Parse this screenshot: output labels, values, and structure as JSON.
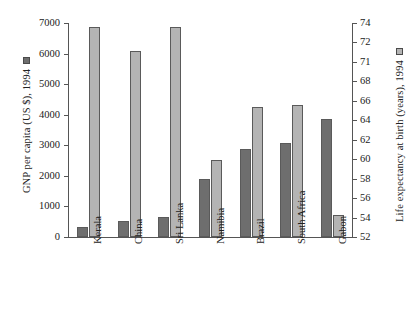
{
  "chart_data": {
    "type": "bar",
    "title": "",
    "subtitle": "",
    "xlabel": "",
    "categories": [
      "Kerala",
      "China",
      "Sri Lanka",
      "Namibia",
      "Brazil",
      "South Africa",
      "Gabon"
    ],
    "grid": false,
    "legend_position": "axis-titles",
    "series": [
      {
        "name": "GNP per capita (US $), 1994",
        "axis": "left",
        "color": "#6e6e6e",
        "unit": "US $",
        "values": [
          340,
          530,
          640,
          1890,
          2890,
          3070,
          3850
        ]
      },
      {
        "name": "Life expectancy at birth (years), 1994",
        "axis": "right",
        "color": "#b4b4b4",
        "unit": "years",
        "values": [
          73.6,
          71.1,
          73.6,
          59.9,
          65.4,
          65.6,
          54.3
        ]
      }
    ],
    "axes": {
      "left": {
        "label": "GNP per capita (US $), 1994",
        "ylim": [
          0,
          7000
        ],
        "ticks": [
          7000,
          6000,
          5000,
          4000,
          3000,
          2000,
          1000,
          0
        ],
        "ticklabels": [
          "7000",
          "6000",
          "5000",
          "4000",
          "3000",
          "2000",
          "1000",
          "0"
        ]
      },
      "right": {
        "label": "Life expectancy at birth (years), 1994",
        "ylim": [
          52,
          74
        ],
        "ticks": [
          74,
          72,
          70,
          68,
          66,
          64,
          62,
          60,
          58,
          56,
          54,
          52
        ],
        "ticklabels": [
          "74",
          "72",
          "71",
          "68",
          "66",
          "64",
          "62",
          "60",
          "58",
          "56",
          "54",
          "52"
        ]
      }
    }
  },
  "legend": {
    "gnp_swatch_name": "gnp-legend-swatch",
    "life_swatch_name": "life-expectancy-legend-swatch"
  }
}
